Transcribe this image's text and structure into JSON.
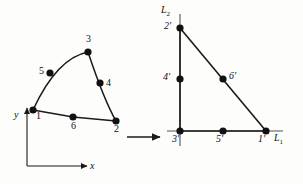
{
  "figure": {
    "stroke_color": "#1a1a1a",
    "node_fill_color": "#111111",
    "background_color": "#fdfdfb",
    "transform_arrow": {
      "name": "mapping-arrow",
      "x1": 127,
      "y1": 137,
      "x2": 162,
      "y2": 137
    },
    "left_element": {
      "name": "curved-element",
      "axes": {
        "x_label": "x",
        "y_label": "y",
        "origin": {
          "x": 27,
          "y": 166
        },
        "x_end": {
          "x": 89,
          "y": 166
        },
        "y_end": {
          "x": 27,
          "y": 106
        }
      },
      "nodes": [
        {
          "id": "1",
          "label": "1",
          "x": 33,
          "y": 110,
          "label_dx": 3,
          "label_dy": 3
        },
        {
          "id": "2",
          "label": "2",
          "x": 116,
          "y": 121,
          "label_dx": -2,
          "label_dy": 5
        },
        {
          "id": "3",
          "label": "3",
          "x": 88,
          "y": 52,
          "label_dx": -2,
          "label_dy": -16
        },
        {
          "id": "4",
          "label": "4",
          "x": 100,
          "y": 83,
          "label_dx": 6,
          "label_dy": -4
        },
        {
          "id": "5",
          "label": "5",
          "x": 50,
          "y": 73,
          "label_dx": -11,
          "label_dy": -5
        },
        {
          "id": "6",
          "label": "6",
          "x": 73,
          "y": 117,
          "label_dx": -2,
          "label_dy": 5
        }
      ],
      "edges": [
        {
          "name": "edge-1-6-2",
          "type": "line",
          "from": "1",
          "to": "2",
          "via": "6"
        },
        {
          "name": "edge-2-4-3",
          "type": "line",
          "from": "2",
          "to": "3",
          "via": "4"
        },
        {
          "name": "edge-3-5-1",
          "type": "curve",
          "from": "3",
          "to": "1",
          "via": "5"
        }
      ]
    },
    "right_element": {
      "name": "reference-triangle",
      "lines": [
        {
          "id": "L1",
          "label": "L",
          "subscript": "1",
          "label_x": 276,
          "label_y": 137
        },
        {
          "id": "L2",
          "label": "L",
          "subscript": "2",
          "label_x": 162,
          "label_y": 6
        }
      ],
      "vertical_line": {
        "x": 180,
        "y1": 14,
        "y2": 146
      },
      "horizontal_line": {
        "x1": 167,
        "x2": 283,
        "y": 131
      },
      "hypotenuse": {
        "x1": 180,
        "y1": 28,
        "x2": 266,
        "y2": 131
      },
      "nodes": [
        {
          "id": "1p",
          "label": "1'",
          "x": 266,
          "y": 131,
          "label_dx": -5,
          "label_dy": 5
        },
        {
          "id": "2p",
          "label": "2'",
          "x": 180,
          "y": 28,
          "label_dx": -14,
          "label_dy": -6
        },
        {
          "id": "3p",
          "label": "3'",
          "x": 180,
          "y": 131,
          "label_dx": -6,
          "label_dy": 5
        },
        {
          "id": "4p",
          "label": "4'",
          "x": 180,
          "y": 79,
          "label_dx": -15,
          "label_dy": -5
        },
        {
          "id": "5p",
          "label": "5'",
          "x": 223,
          "y": 131,
          "label_dx": -5,
          "label_dy": 5
        },
        {
          "id": "6p",
          "label": "6'",
          "x": 223,
          "y": 79,
          "label_dx": 6,
          "label_dy": -6
        }
      ]
    }
  }
}
